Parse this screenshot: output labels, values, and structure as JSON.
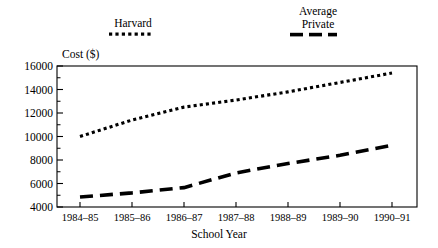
{
  "chart_data": {
    "type": "line",
    "title": "",
    "xlabel": "School Year",
    "ylabel": "Cost ($)",
    "categories": [
      "1984–85",
      "1985–86",
      "1986–87",
      "1987–88",
      "1988–89",
      "1989–90",
      "1990–91"
    ],
    "ylim": [
      4000,
      16000
    ],
    "yticks": [
      4000,
      6000,
      8000,
      10000,
      12000,
      14000,
      16000
    ],
    "ytick_labels": [
      "4000",
      "6000",
      "8000",
      "10000",
      "12000",
      "14000",
      "16000"
    ],
    "minor_yticks": [
      5000,
      7000,
      9000,
      11000,
      13000,
      15000
    ],
    "grid": false,
    "legend_position": "above-plot",
    "series": [
      {
        "name": "Harvard",
        "linestyle": "dotted",
        "color": "#000000",
        "values": [
          10000,
          11400,
          12500,
          13100,
          13800,
          14600,
          15400
        ]
      },
      {
        "name": "Average Private",
        "linestyle": "dashed",
        "color": "#000000",
        "values": [
          4850,
          5200,
          5650,
          6900,
          7700,
          8400,
          9250
        ]
      }
    ]
  },
  "legend": {
    "harvard": {
      "label": "Harvard",
      "sample": "dotted-line-sample"
    },
    "average_private": {
      "line1": "Average",
      "line2": "Private",
      "sample": "dashed-line-sample"
    }
  },
  "axes": {
    "y_title": "Cost ($)",
    "x_title": "School Year"
  }
}
